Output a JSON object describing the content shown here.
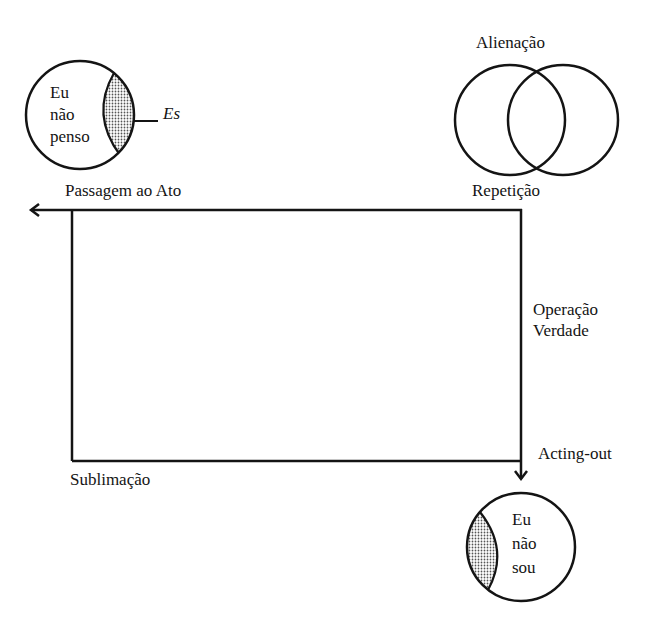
{
  "diagram": {
    "colors": {
      "stroke": "#141414",
      "background": "#ffffff",
      "hatch": "#8a8a8a"
    },
    "nodes": {
      "top_left_circle": {
        "lines": [
          "Eu",
          "não",
          "penso"
        ],
        "shaded_label": "Es"
      },
      "venn": {
        "top_label": "Alienação",
        "bottom_label": "Repetição"
      },
      "bottom_circle": {
        "lines": [
          "Eu",
          "não",
          "sou"
        ]
      }
    },
    "edges": {
      "top": "Passagem ao Ato",
      "right": [
        "Operação",
        "Verdade"
      ],
      "bottom_right": "Acting-out",
      "bottom_left": "Sublimação"
    }
  }
}
